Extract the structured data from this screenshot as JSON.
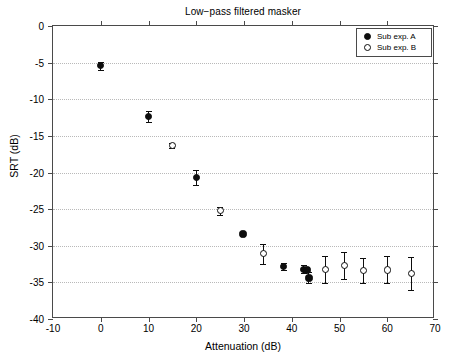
{
  "chart_data": {
    "type": "scatter",
    "title": "Low−pass filtered masker",
    "xlabel": "Attenuation (dB)",
    "ylabel": "SRT (dB)",
    "xlim": [
      -10,
      70
    ],
    "ylim": [
      -40,
      0
    ],
    "xticks": [
      -10,
      0,
      10,
      20,
      30,
      40,
      50,
      60,
      70
    ],
    "yticks": [
      0,
      -5,
      -10,
      -15,
      -20,
      -25,
      -30,
      -35,
      -40
    ],
    "xtick_labels": [
      "-10",
      "0",
      "10",
      "20",
      "30",
      "40",
      "50",
      "60",
      "70"
    ],
    "ytick_labels": [
      "0",
      "-5",
      "-10",
      "-15",
      "-20",
      "-25",
      "-30",
      "-35",
      "-40"
    ],
    "grid": "horizontal-dotted",
    "legend_position": "top-right",
    "series": [
      {
        "name": "Sub exp. A",
        "marker": "filled-circle",
        "color": "#0d0d0d",
        "points": [
          {
            "x": 0,
            "y": -5.4,
            "err": 0.55
          },
          {
            "x": 10,
            "y": -12.3,
            "err": 0.75
          },
          {
            "x": 20,
            "y": -20.7,
            "err": 1.05
          },
          {
            "x": 29.8,
            "y": -28.4,
            "err": 0.25
          },
          {
            "x": 38.3,
            "y": -32.8,
            "err": 0.45
          },
          {
            "x": 42.5,
            "y": -33.2,
            "err": 0.55
          },
          {
            "x": 43.2,
            "y": -33.3,
            "err": 0.35
          },
          {
            "x": 43.6,
            "y": -34.4,
            "err": 0.75
          }
        ]
      },
      {
        "name": "Sub exp. B",
        "marker": "open-circle",
        "color": "#0d0d0d",
        "points": [
          {
            "x": 15,
            "y": -16.3,
            "err": 0.35
          },
          {
            "x": 25,
            "y": -25.2,
            "err": 0.55
          },
          {
            "x": 34,
            "y": -31.1,
            "err": 1.35
          },
          {
            "x": 47,
            "y": -33.2,
            "err": 1.85
          },
          {
            "x": 51,
            "y": -32.7,
            "err": 1.85
          },
          {
            "x": 55,
            "y": -33.4,
            "err": 1.75
          },
          {
            "x": 60,
            "y": -33.3,
            "err": 1.85
          },
          {
            "x": 65,
            "y": -33.8,
            "err": 2.25
          }
        ]
      }
    ]
  },
  "legend": {
    "items": [
      {
        "label": "Sub exp. A",
        "marker": "filled-circle"
      },
      {
        "label": "Sub exp. B",
        "marker": "open-circle"
      }
    ]
  },
  "colors": {
    "axis": "#4a4a4a",
    "grid": "#b9b9b9",
    "marker": "#0d0d0d",
    "background": "#ffffff"
  }
}
